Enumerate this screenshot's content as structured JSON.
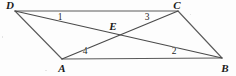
{
  "figure": {
    "kind": "geometry-diagram",
    "background_color": "#fdfdfd",
    "stroke_color": "#4a4a4a",
    "label_color": "#1a1a1a",
    "width": 236,
    "height": 76,
    "vertices": [
      {
        "name": "D",
        "label": "D",
        "x": 15,
        "y": 11,
        "label_x": 10,
        "label_y": 5
      },
      {
        "name": "C",
        "label": "C",
        "x": 178,
        "y": 11,
        "label_x": 177,
        "label_y": 5
      },
      {
        "name": "A",
        "label": "A",
        "x": 62,
        "y": 59,
        "label_x": 62,
        "label_y": 68
      },
      {
        "name": "B",
        "label": "B",
        "x": 222,
        "y": 58,
        "label_x": 225,
        "label_y": 68
      },
      {
        "name": "E",
        "label": "E",
        "x": 118,
        "y": 34,
        "label_x": 113,
        "label_y": 26
      }
    ],
    "edges": [
      {
        "name": "side-DC",
        "from": "D",
        "to": "C"
      },
      {
        "name": "side-AB",
        "from": "A",
        "to": "B"
      },
      {
        "name": "side-DA",
        "from": "D",
        "to": "A"
      },
      {
        "name": "side-CB",
        "from": "C",
        "to": "B"
      },
      {
        "name": "diagonal-DB",
        "from": "D",
        "to": "B"
      },
      {
        "name": "diagonal-AC",
        "from": "A",
        "to": "C"
      }
    ],
    "angle_labels": [
      {
        "name": "angle-1",
        "text": "1",
        "x": 60,
        "y": 18
      },
      {
        "name": "angle-3",
        "text": "3",
        "x": 147,
        "y": 18
      },
      {
        "name": "angle-4",
        "text": "4",
        "x": 85,
        "y": 52
      },
      {
        "name": "angle-2",
        "text": "2",
        "x": 174,
        "y": 52
      }
    ]
  }
}
